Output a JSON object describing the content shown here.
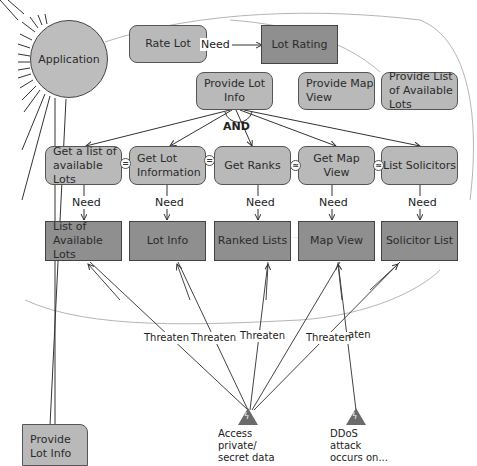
{
  "actor": {
    "name": "Application"
  },
  "top": {
    "rate_lot": "Rate Lot",
    "need_label": "Need",
    "lot_rating": "Lot Rating"
  },
  "goals": {
    "provide_lot_info": "Provide Lot Info",
    "provide_map_view": "Provide Map View",
    "provide_list_available_lots": "Provide List of Available Lots",
    "and_label": "AND"
  },
  "tasks": [
    {
      "label": "Get a list of available Lots",
      "need": "Need",
      "resource": "List of Available Lots"
    },
    {
      "label": "Get Lot Information",
      "need": "Need",
      "resource": "Lot Info"
    },
    {
      "label": "Get Ranks",
      "need": "Need",
      "resource": "Ranked Lists"
    },
    {
      "label": "Get Map View",
      "need": "Need",
      "resource": "Map View"
    },
    {
      "label": "List Solicitors",
      "need": "Need",
      "resource": "Solicitor List"
    }
  ],
  "connectors": [
    "=",
    "=",
    "≈",
    "≈"
  ],
  "threaten_labels": [
    "Threaten",
    "Threaten",
    "Threaten",
    "Threaten",
    "aten"
  ],
  "threats": [
    {
      "label": "Access private/ secret data",
      "icon": "lightning-icon"
    },
    {
      "label": "DDoS attack occurs on...",
      "icon": "lightning-icon"
    }
  ],
  "bottom_left": {
    "label": "Provide Lot Info"
  }
}
